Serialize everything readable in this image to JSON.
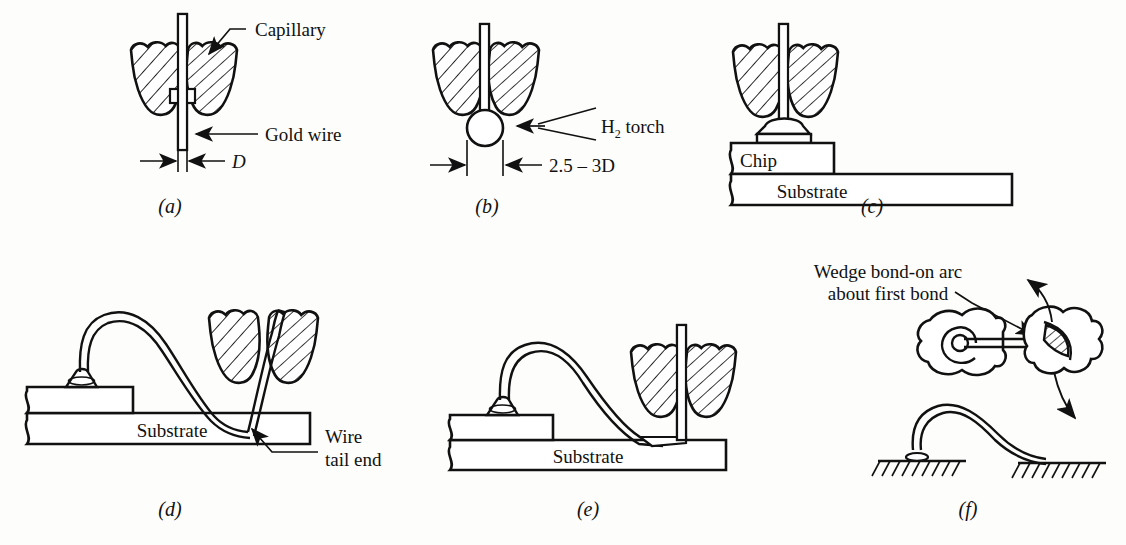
{
  "figure": {
    "title_present": false,
    "background_color": "#fdfdfb",
    "line_color": "#111111",
    "panel_count": 6
  },
  "panels": [
    {
      "id": "a",
      "letter": "(a)",
      "description": "Capillary holding gold wire before ball formation",
      "labels": [
        {
          "name": "capillary",
          "text": "Capillary"
        },
        {
          "name": "gold-wire",
          "text": "Gold wire"
        }
      ],
      "dimensions": [
        {
          "name": "wire-diameter",
          "text": "D"
        }
      ]
    },
    {
      "id": "b",
      "letter": "(b)",
      "description": "Hydrogen torch forms a ball on the wire tip",
      "labels": [
        {
          "name": "h2-torch",
          "text_main": "H",
          "text_sub": "2",
          "text_rest": " torch",
          "text_full": "H2 torch"
        }
      ],
      "dimensions": [
        {
          "name": "ball-diameter",
          "text": "2.5 – 3D"
        }
      ]
    },
    {
      "id": "c",
      "letter": "(c)",
      "description": "Ball bonded to chip bond pad by capillary",
      "labels": [
        {
          "name": "chip",
          "text": "Chip"
        },
        {
          "name": "substrate",
          "text": "Substrate"
        }
      ],
      "dimensions": []
    },
    {
      "id": "d",
      "letter": "(d)",
      "description": "Wire looped to substrate and wedge bonded, wire tail left",
      "labels": [
        {
          "name": "substrate",
          "text": "Substrate"
        },
        {
          "name": "wire-tail-end-line1",
          "text": "Wire"
        },
        {
          "name": "wire-tail-end-line2",
          "text": "tail end"
        }
      ],
      "dimensions": []
    },
    {
      "id": "e",
      "letter": "(e)",
      "description": "Completed bond, capillary raised with new wire tail",
      "labels": [
        {
          "name": "substrate",
          "text": "Substrate"
        }
      ],
      "dimensions": []
    },
    {
      "id": "f",
      "letter": "(f)",
      "description": "Plan and side view of wedge bond placed on arc about the first bond",
      "labels": [
        {
          "name": "wedge-bond-arc-line1",
          "text": "Wedge bond-on arc"
        },
        {
          "name": "wedge-bond-arc-line2",
          "text": "about first bond"
        }
      ],
      "dimensions": []
    }
  ]
}
